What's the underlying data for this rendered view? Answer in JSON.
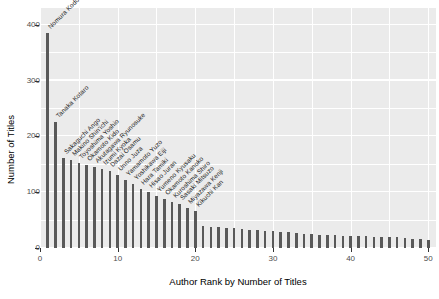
{
  "chart_data": {
    "type": "bar",
    "title": "",
    "subtitle": "",
    "xlabel": "Author Rank by Number of Titles",
    "ylabel": "Number of Titles",
    "xlim": [
      0,
      51
    ],
    "ylim": [
      0,
      430
    ],
    "grid": true,
    "legend": "none",
    "y_ticks": [
      0,
      100,
      200,
      300,
      400
    ],
    "y_minor_ticks": [
      50,
      150,
      250,
      350
    ],
    "x_ticks": [
      0,
      10,
      20,
      30,
      40,
      50
    ],
    "x_minor_ticks": [
      5,
      15,
      25,
      35,
      45
    ],
    "bar_color": "#595959",
    "panel_color": "#ebebeb",
    "grid_color": "#ffffff",
    "categories": [
      1,
      2,
      3,
      4,
      5,
      6,
      7,
      8,
      9,
      10,
      11,
      12,
      13,
      14,
      15,
      16,
      17,
      18,
      19,
      20,
      21,
      22,
      23,
      24,
      25,
      26,
      27,
      28,
      29,
      30,
      31,
      32,
      33,
      34,
      35,
      36,
      37,
      38,
      39,
      40,
      41,
      42,
      43,
      44,
      45,
      46,
      47,
      48,
      49,
      50
    ],
    "values": [
      385,
      225,
      162,
      158,
      152,
      148,
      145,
      142,
      138,
      130,
      122,
      114,
      106,
      100,
      94,
      88,
      83,
      78,
      72,
      66,
      40,
      38,
      37,
      36,
      35,
      34,
      33,
      32,
      31,
      30,
      29,
      28,
      27,
      26,
      25,
      24,
      24,
      23,
      22,
      22,
      21,
      21,
      20,
      20,
      19,
      19,
      18,
      17,
      16,
      15
    ],
    "point_labels": [
      "Nomura Kodo",
      "Tanaka Kotaro",
      "Sakaguchi Ango",
      "Makino Shin'ichi",
      "Toyoshima Yoshio",
      "Okamoto Kido",
      "Akutagawa Ryunosuke",
      "Izumi Kyoka",
      "Dazai Osamu",
      "Unno Juza",
      "Yamamoto Yuzo",
      "Yoshikawa Eiji",
      "Hara Tamiki",
      "Hisao Juran",
      "Yumeno Kyusaku",
      "Okamoto Kanoko",
      "Kuroshima Shiro",
      "Sasaki Mitsuzo",
      "Miyazawa Kenji",
      "Kikuchi Kan"
    ]
  }
}
